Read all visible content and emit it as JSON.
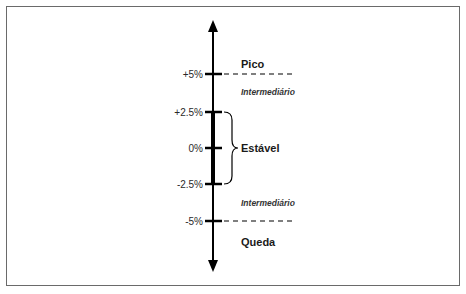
{
  "diagram": {
    "type": "vertical-scale",
    "ticks": [
      {
        "label": "+5%",
        "value": 5
      },
      {
        "label": "+2.5%",
        "value": 2.5
      },
      {
        "label": "0%",
        "value": 0
      },
      {
        "label": "-2.5%",
        "value": -2.5
      },
      {
        "label": "-5%",
        "value": -5
      }
    ],
    "zones": {
      "peak": "Pico",
      "upper_intermediate": "Intermediário",
      "stable": "Estável",
      "lower_intermediate": "Intermediário",
      "drop": "Queda"
    },
    "colors": {
      "axis": "#000000",
      "frame": "#6a6a6a",
      "text": "#1a1a1a"
    }
  }
}
